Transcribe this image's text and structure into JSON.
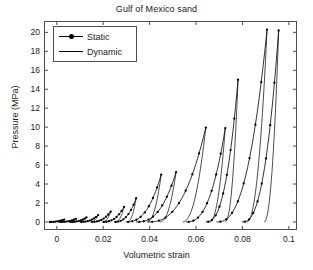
{
  "chart_data": {
    "type": "line",
    "title": "Gulf of Mexico sand",
    "xlabel": "Volumetric strain",
    "ylabel": "Pressure (MPa)",
    "xlim": [
      -0.0055,
      0.1035
    ],
    "ylim": [
      -0.85,
      21.2
    ],
    "xticks": [
      "0",
      "0.02",
      "0.04",
      "0.06",
      "0.08",
      "0.1"
    ],
    "xtick_values": [
      0,
      0.02,
      0.04,
      0.06,
      0.08,
      0.1
    ],
    "yticks": [
      "0",
      "2",
      "4",
      "6",
      "8",
      "10",
      "12",
      "14",
      "16",
      "18",
      "20"
    ],
    "ytick_values": [
      0,
      2,
      4,
      6,
      8,
      10,
      12,
      14,
      16,
      18,
      20
    ],
    "grid": false,
    "legend_position": "upper left",
    "legend": [
      {
        "name": "Static",
        "marker": "dot",
        "line": "solid"
      },
      {
        "name": "Dynamic",
        "marker": "none",
        "line": "solid"
      }
    ],
    "series": [
      {
        "name": "Static",
        "style": "line-with-markers",
        "comment": "Cyclic load-unload hysteresis loops, markers on path",
        "points": [
          [
            -0.003,
            0.05
          ],
          [
            -0.001,
            0.1
          ],
          [
            0.001,
            0.16
          ],
          [
            0.003,
            0.22
          ],
          [
            0.0015,
            0.06
          ],
          [
            0.0035,
            0.12
          ],
          [
            0.0055,
            0.2
          ],
          [
            0.008,
            0.3
          ],
          [
            0.006,
            0.08
          ],
          [
            0.0085,
            0.18
          ],
          [
            0.0105,
            0.3
          ],
          [
            0.0125,
            0.45
          ],
          [
            0.0105,
            0.1
          ],
          [
            0.013,
            0.25
          ],
          [
            0.0155,
            0.45
          ],
          [
            0.0175,
            0.7
          ],
          [
            0.015,
            0.12
          ],
          [
            0.018,
            0.35
          ],
          [
            0.0205,
            0.65
          ],
          [
            0.023,
            1.05
          ],
          [
            0.02,
            0.14
          ],
          [
            0.0235,
            0.5
          ],
          [
            0.0262,
            0.95
          ],
          [
            0.0288,
            1.55
          ],
          [
            0.025,
            0.16
          ],
          [
            0.0285,
            0.7
          ],
          [
            0.0315,
            1.5
          ],
          [
            0.034,
            2.45
          ],
          [
            0.03,
            0.18
          ],
          [
            0.034,
            0.8
          ],
          [
            0.038,
            2.0
          ],
          [
            0.042,
            3.4
          ],
          [
            0.0448,
            4.95
          ],
          [
            0.0345,
            0.2
          ],
          [
            0.0395,
            0.9
          ],
          [
            0.0445,
            2.4
          ],
          [
            0.049,
            4.0
          ],
          [
            0.0512,
            5.2
          ],
          [
            0.043,
            0.22
          ],
          [
            0.049,
            1.1
          ],
          [
            0.0548,
            3.2
          ],
          [
            0.06,
            6.2
          ],
          [
            0.064,
            9.9
          ],
          [
            0.056,
            0.25
          ],
          [
            0.0605,
            1.2
          ],
          [
            0.065,
            3.6
          ],
          [
            0.069,
            6.8
          ],
          [
            0.0725,
            9.85
          ],
          [
            0.0645,
            0.28
          ],
          [
            0.069,
            1.4
          ],
          [
            0.073,
            4.2
          ],
          [
            0.0762,
            8.5
          ],
          [
            0.078,
            14.95
          ],
          [
            0.069,
            0.3
          ],
          [
            0.074,
            1.6
          ],
          [
            0.079,
            4.6
          ],
          [
            0.084,
            9.6
          ],
          [
            0.0878,
            15.05
          ],
          [
            0.0905,
            20.3
          ],
          [
            0.08,
            0.32
          ],
          [
            0.0845,
            1.7
          ],
          [
            0.0885,
            5.0
          ],
          [
            0.0918,
            9.9
          ],
          [
            0.094,
            15.0
          ],
          [
            0.0955,
            20.2
          ]
        ]
      },
      {
        "name": "Dynamic",
        "style": "line",
        "comment": "Smooth unloading/reloading branches without markers",
        "points": [
          [
            0.0448,
            4.95
          ],
          [
            0.043,
            2.6
          ],
          [
            0.0412,
            1.2
          ],
          [
            0.0398,
            0.45
          ],
          [
            0.039,
            0.18
          ],
          [
            0.0512,
            5.2
          ],
          [
            0.0492,
            2.8
          ],
          [
            0.0472,
            1.3
          ],
          [
            0.0455,
            0.5
          ],
          [
            0.0445,
            0.2
          ],
          [
            0.064,
            9.9
          ],
          [
            0.0628,
            6.0
          ],
          [
            0.0612,
            3.0
          ],
          [
            0.0595,
            1.3
          ],
          [
            0.0578,
            0.5
          ],
          [
            0.0568,
            0.22
          ],
          [
            0.0725,
            9.85
          ],
          [
            0.0712,
            6.1
          ],
          [
            0.0698,
            3.1
          ],
          [
            0.0682,
            1.35
          ],
          [
            0.0668,
            0.52
          ],
          [
            0.0658,
            0.24
          ],
          [
            0.078,
            14.95
          ],
          [
            0.077,
            9.5
          ],
          [
            0.0756,
            5.2
          ],
          [
            0.074,
            2.4
          ],
          [
            0.0722,
            0.95
          ],
          [
            0.0706,
            0.35
          ],
          [
            0.0698,
            0.18
          ],
          [
            0.0905,
            20.3
          ],
          [
            0.0896,
            14.0
          ],
          [
            0.0884,
            8.5
          ],
          [
            0.0868,
            4.2
          ],
          [
            0.0848,
            1.8
          ],
          [
            0.0828,
            0.7
          ],
          [
            0.0812,
            0.26
          ],
          [
            0.0955,
            20.2
          ],
          [
            0.0948,
            14.2
          ],
          [
            0.0936,
            8.8
          ],
          [
            0.092,
            4.4
          ],
          [
            0.09,
            1.9
          ],
          [
            0.088,
            0.72
          ],
          [
            0.0862,
            0.28
          ]
        ]
      }
    ]
  }
}
